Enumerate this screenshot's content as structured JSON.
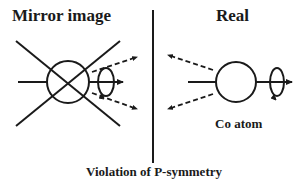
{
  "left_panel": {
    "title": "Mirror image"
  },
  "right_panel": {
    "title": "Real",
    "atom_label": "Co atom"
  },
  "caption": "Violation of P-symmetry",
  "colors": {
    "stroke": "#1a1a1a",
    "background": "#ffffff"
  }
}
